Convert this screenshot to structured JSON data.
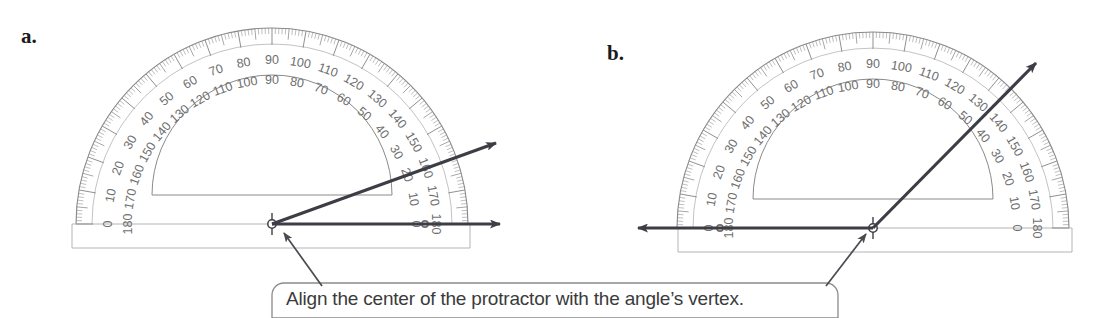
{
  "page": {
    "background_color": "#ffffff",
    "width": 1096,
    "height": 318
  },
  "figures": [
    {
      "id": "a",
      "label": "a.",
      "center": {
        "x": 272,
        "y": 224
      },
      "outer_radius": 196,
      "inner_cutout_radius": 120,
      "base_plate": {
        "left": 72,
        "right": 470,
        "bottom": 248
      },
      "rays": [
        {
          "name": "horizontal-ray",
          "angle_deg": 0,
          "tip": {
            "x": 500,
            "y": 224
          }
        },
        {
          "name": "angle-ray",
          "angle_deg": 20,
          "tip": {
            "x": 496,
            "y": 143
          }
        }
      ],
      "measured_angle_deg": 20
    },
    {
      "id": "b",
      "label": "b.",
      "center": {
        "x": 873,
        "y": 228
      },
      "outer_radius": 196,
      "inner_cutout_radius": 120,
      "base_plate": {
        "left": 678,
        "right": 1072,
        "bottom": 252
      },
      "rays": [
        {
          "name": "horizontal-ray",
          "angle_deg": 180,
          "tip": {
            "x": 638,
            "y": 228
          }
        },
        {
          "name": "angle-ray",
          "angle_deg": 45,
          "tip": {
            "x": 1036,
            "y": 63
          }
        }
      ],
      "measured_angle_deg": 45
    }
  ],
  "protractor_scale": {
    "outer_scale_labels": [
      0,
      10,
      20,
      30,
      40,
      50,
      60,
      70,
      80,
      90,
      100,
      110,
      120,
      130,
      140,
      150,
      160,
      170,
      180
    ],
    "inner_scale_labels": [
      180,
      170,
      160,
      150,
      140,
      130,
      120,
      110,
      100,
      90,
      80,
      70,
      60,
      50,
      40,
      30,
      20,
      10,
      0
    ],
    "minor_tick_interval_deg": 1,
    "major_tick_interval_deg": 10,
    "line_color": "#8a8a8a",
    "number_color": "#6e6e6e"
  },
  "callout": {
    "text": "Align the center of the protractor with the angle’s vertex.",
    "box": {
      "left": 272,
      "top": 283,
      "right": 838,
      "bottom": 318,
      "corner_radius": 12
    },
    "border_color": "#8a8a8a",
    "text_color": "#3b3b3b",
    "pointers": [
      {
        "name": "pointer-to-figure-a",
        "from": {
          "x": 322,
          "y": 286
        },
        "to": {
          "x": 284,
          "y": 233
        }
      },
      {
        "name": "pointer-to-figure-b",
        "from": {
          "x": 826,
          "y": 286
        },
        "to": {
          "x": 866,
          "y": 234
        }
      }
    ]
  },
  "colors": {
    "ray_dark": "#3d3d46",
    "protractor_line": "#8a8a8a",
    "protractor_faint": "#b4b4b4",
    "text_dark": "#1a1a1a"
  }
}
